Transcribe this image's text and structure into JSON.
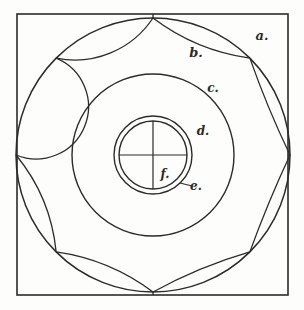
{
  "figure": {
    "type": "line-diagram",
    "background_color": "#fdfdfc",
    "ink_color": "#2b2b2b"
  },
  "frame": {
    "name": "square-border",
    "x": 17,
    "y": 14,
    "width": 271,
    "height": 281,
    "stroke_width": 1.6
  },
  "geometry": {
    "center_x": 153,
    "center_y": 155,
    "outer_circle_radius": 137,
    "middle_circle_radius": 81,
    "small_outer_circle_radius": 39,
    "small_inner_circle_radius": 34,
    "petal_count": 8,
    "crosshair_length": 34
  },
  "labels": [
    {
      "key": "a",
      "text": "a.",
      "x": 262,
      "y": 40,
      "size": 13,
      "leader": false
    },
    {
      "key": "b",
      "text": "b.",
      "x": 196,
      "y": 57,
      "size": 13,
      "leader": false
    },
    {
      "key": "c",
      "text": "c.",
      "x": 213,
      "y": 92,
      "size": 12,
      "leader": false
    },
    {
      "key": "d",
      "text": "d.",
      "x": 203,
      "y": 135,
      "size": 12,
      "leader": false
    },
    {
      "key": "f",
      "text": "f.",
      "x": 165,
      "y": 178,
      "size": 12,
      "leader": false
    },
    {
      "key": "e",
      "text": "e.",
      "x": 196,
      "y": 190,
      "size": 12,
      "leader": true
    }
  ],
  "leader_line": {
    "name": "leader-line-e",
    "x1": 180,
    "y1": 183,
    "x2": 192,
    "y2": 186
  },
  "legend": {
    "a": "outer square field / corner spandrel",
    "b": "outer petal lobe",
    "c": "curvilinear triangle between lobes",
    "d": "middle annular band",
    "e": "outer boss ring",
    "f": "inner boss with cross division"
  }
}
